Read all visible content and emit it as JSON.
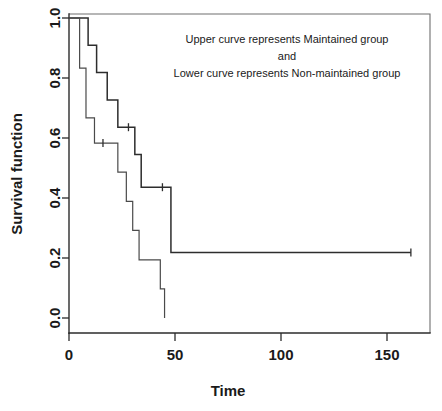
{
  "chart_data": {
    "type": "line",
    "subtype": "kaplan-meier-step",
    "title": "",
    "xlabel": "Time",
    "ylabel": "Survival function",
    "xlim": [
      0,
      170
    ],
    "ylim": [
      0.0,
      1.0
    ],
    "grid": false,
    "legend_position": "inside-top-right",
    "xticks": [
      0,
      50,
      100,
      150
    ],
    "xticklabels": [
      "0",
      "50",
      "100",
      "150"
    ],
    "yticks": [
      0.0,
      0.2,
      0.4,
      0.6,
      0.8,
      1.0
    ],
    "yticklabels": [
      "0.0",
      "0.2",
      "0.4",
      "0.6",
      "0.8",
      "1.0"
    ],
    "annotations": [
      "Upper curve represents Maintained group",
      "and",
      "Lower curve represents Non-maintained group"
    ],
    "series": [
      {
        "name": "Maintained",
        "role": "upper-curve",
        "points": [
          {
            "t": 0,
            "s": 1.0
          },
          {
            "t": 9,
            "s": 1.0
          },
          {
            "t": 9,
            "s": 0.909
          },
          {
            "t": 13,
            "s": 0.909
          },
          {
            "t": 13,
            "s": 0.818
          },
          {
            "t": 18,
            "s": 0.818
          },
          {
            "t": 18,
            "s": 0.727
          },
          {
            "t": 23,
            "s": 0.727
          },
          {
            "t": 23,
            "s": 0.636
          },
          {
            "t": 31,
            "s": 0.636
          },
          {
            "t": 31,
            "s": 0.545
          },
          {
            "t": 34,
            "s": 0.545
          },
          {
            "t": 34,
            "s": 0.436
          },
          {
            "t": 48,
            "s": 0.436
          },
          {
            "t": 48,
            "s": 0.218
          },
          {
            "t": 161,
            "s": 0.218
          }
        ],
        "censored": [
          {
            "t": 28,
            "s": 0.636
          },
          {
            "t": 44,
            "s": 0.436
          },
          {
            "t": 161,
            "s": 0.218
          }
        ]
      },
      {
        "name": "Non-maintained",
        "role": "lower-curve",
        "points": [
          {
            "t": 0,
            "s": 1.0
          },
          {
            "t": 5,
            "s": 1.0
          },
          {
            "t": 5,
            "s": 0.833
          },
          {
            "t": 8,
            "s": 0.833
          },
          {
            "t": 8,
            "s": 0.667
          },
          {
            "t": 12,
            "s": 0.667
          },
          {
            "t": 12,
            "s": 0.583
          },
          {
            "t": 23,
            "s": 0.583
          },
          {
            "t": 23,
            "s": 0.486
          },
          {
            "t": 27,
            "s": 0.486
          },
          {
            "t": 27,
            "s": 0.389
          },
          {
            "t": 30,
            "s": 0.389
          },
          {
            "t": 30,
            "s": 0.292
          },
          {
            "t": 33,
            "s": 0.292
          },
          {
            "t": 33,
            "s": 0.194
          },
          {
            "t": 43,
            "s": 0.194
          },
          {
            "t": 43,
            "s": 0.097
          },
          {
            "t": 45,
            "s": 0.097
          },
          {
            "t": 45,
            "s": 0.0
          }
        ],
        "censored": [
          {
            "t": 16,
            "s": 0.583
          }
        ]
      }
    ]
  },
  "axes": {
    "xlabel": "Time",
    "ylabel": "Survival function"
  }
}
